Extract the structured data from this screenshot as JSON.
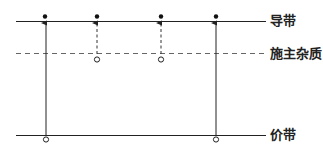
{
  "labels": {
    "conduction_band": "导带",
    "donor_level": "施主杂质",
    "valence_band": "价带"
  },
  "colors": {
    "line": "#222222",
    "dashed": "#555555"
  }
}
